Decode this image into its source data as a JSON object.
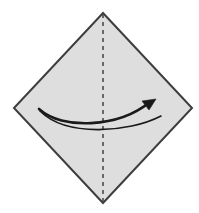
{
  "figure": {
    "width": 199,
    "height": 213,
    "background_color": "#ffffff"
  },
  "paper": {
    "shape_name": "diamond",
    "description": "Square sheet of paper rotated 45 degrees",
    "fill_color": "#dedede",
    "edge_color": "#3d3d3d",
    "edge_width": 2,
    "vertices": {
      "top": {
        "x": 103,
        "y": 13
      },
      "right": {
        "x": 192,
        "y": 108
      },
      "bottom": {
        "x": 103,
        "y": 203
      },
      "left": {
        "x": 14,
        "y": 108
      }
    },
    "points_string": "103,13 192,108 103,203 14,108"
  },
  "fold_line": {
    "style": "dashed",
    "meaning": "valley-fold-crease",
    "color": "#4a4a4a",
    "width": 1.6,
    "dash_pattern": "4 4",
    "x": 103,
    "y_start": 14,
    "y_end": 202
  },
  "motion_arrow": {
    "meaning": "fold-right-side-over",
    "color": "#1a1a1a",
    "upper_line": {
      "width": 2.6,
      "path": "M 39,109 C 62,130 118,128 150,102"
    },
    "lower_line": {
      "width": 1.6,
      "path": "M 40,111 C 66,137 128,133 161,116"
    },
    "arrowhead": {
      "points": "156,99 142,101 149,110",
      "fill": "#1a1a1a"
    },
    "tail": {
      "x": 39,
      "y": 109
    },
    "tip": {
      "x": 156,
      "y": 99
    }
  }
}
